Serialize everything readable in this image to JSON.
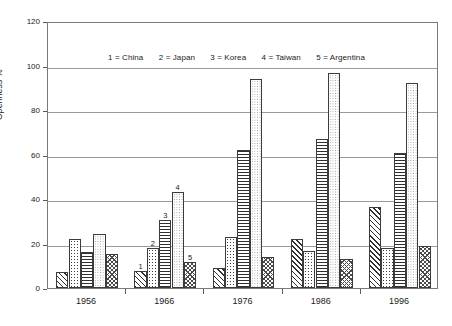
{
  "chart_data": {
    "type": "bar",
    "title": "",
    "xlabel": "",
    "ylabel": "Openness %",
    "ylim": [
      0,
      120
    ],
    "ytick_step": 20,
    "yticks": [
      0,
      20,
      40,
      60,
      80,
      100,
      120
    ],
    "grid": true,
    "legend_position": "inside-top-left",
    "legend_text": "1 = China   2 = Japan   3 = Korea   4 = Taiwan   5 = Argentina",
    "legend_entries": [
      {
        "key": "1",
        "eq": "=",
        "label": "China"
      },
      {
        "key": "2",
        "eq": "=",
        "label": "Japan"
      },
      {
        "key": "3",
        "eq": "=",
        "label": "Korea"
      },
      {
        "key": "4",
        "eq": "=",
        "label": "Taiwan"
      },
      {
        "key": "5",
        "eq": "=",
        "label": "Argentina"
      }
    ],
    "categories": [
      "1956",
      "1966",
      "1976",
      "1986",
      "1996"
    ],
    "series": [
      {
        "name": "China",
        "key": "1",
        "pattern": "diagonal-hatch",
        "values": [
          7,
          7.5,
          9,
          22,
          36.5
        ]
      },
      {
        "name": "Japan",
        "key": "2",
        "pattern": "dots",
        "values": [
          22,
          18,
          23,
          16.5,
          18
        ]
      },
      {
        "name": "Korea",
        "key": "3",
        "pattern": "horizontal-lines",
        "values": [
          16,
          30.5,
          62,
          67,
          60.5
        ]
      },
      {
        "name": "Taiwan",
        "key": "4",
        "pattern": "fine-dots",
        "values": [
          24.5,
          43,
          94,
          96.5,
          92
        ]
      },
      {
        "name": "Argentina",
        "key": "5",
        "pattern": "cross-hatch",
        "values": [
          15.5,
          11.5,
          14,
          13,
          19
        ]
      }
    ],
    "point_annotations": [
      {
        "group": "1966",
        "series": "China",
        "text": "1"
      },
      {
        "group": "1966",
        "series": "Japan",
        "text": "2"
      },
      {
        "group": "1966",
        "series": "Korea",
        "text": "3"
      },
      {
        "group": "1966",
        "series": "Taiwan",
        "text": "4"
      },
      {
        "group": "1966",
        "series": "Argentina",
        "text": "5"
      }
    ],
    "colors": {
      "axis": "#5a5a5a",
      "grid": "#9a9a9a",
      "bar_outline": "#3c3c3c",
      "bar_fill": "#ffffff",
      "text": "#1a1a1a",
      "plot_border": "#7a7a7a"
    }
  }
}
